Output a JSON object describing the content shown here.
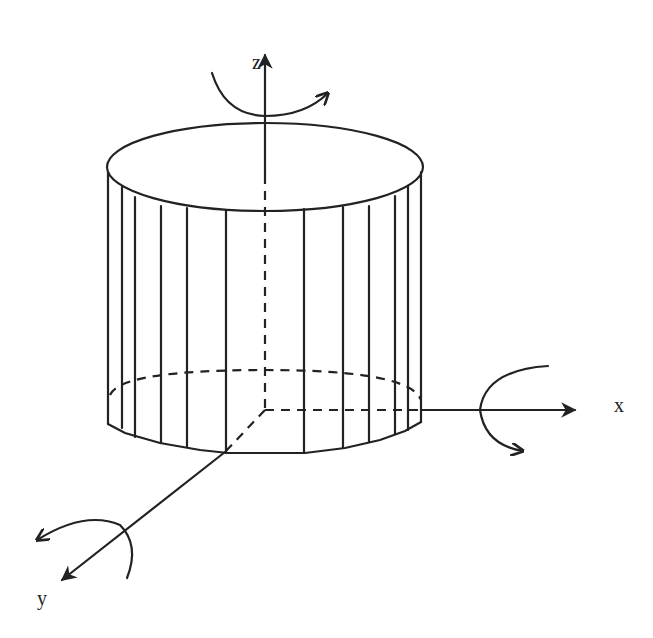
{
  "diagram": {
    "axes": {
      "z": {
        "label": "z"
      },
      "x": {
        "label": "x"
      },
      "y": {
        "label": "y"
      }
    },
    "colors": {
      "ink": "#222222",
      "background": "#ffffff"
    }
  }
}
